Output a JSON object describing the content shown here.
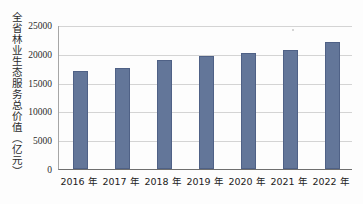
{
  "chart_data": {
    "type": "bar",
    "title": "",
    "xlabel": "",
    "ylabel": "全省林业生态服务总价值（亿元）",
    "categories": [
      "2016 年",
      "2017 年",
      "2018 年",
      "2019 年",
      "2020 年",
      "2021 年",
      "2022 年"
    ],
    "values": [
      17000,
      17500,
      19000,
      19700,
      20200,
      20700,
      22100
    ],
    "ylim": [
      0,
      25000
    ],
    "yticks": [
      0,
      5000,
      10000,
      15000,
      20000,
      25000
    ],
    "ytick_labels": [
      "0",
      "5000",
      "10000",
      "15000",
      "20000",
      "25000"
    ],
    "grid": true,
    "legend": "none",
    "series": [
      {
        "name": "全省林业生态服务总价值",
        "values": [
          17000,
          17500,
          19000,
          19700,
          20200,
          20700,
          22100
        ]
      }
    ],
    "colors": {
      "bar_fill": "#637699",
      "bar_stroke": "#4f6186",
      "gridline": "#d4d4d4",
      "axis": "#6f6f6f",
      "text": "#2b2b2b",
      "background": "#fdfdfd"
    }
  }
}
